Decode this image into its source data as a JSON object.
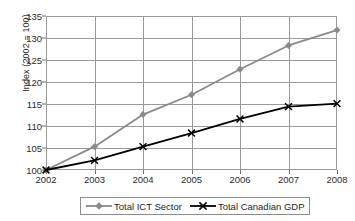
{
  "chart_data": {
    "type": "line",
    "title": "",
    "xlabel": "",
    "ylabel": "Index (2002 = 100)",
    "x": [
      2002,
      2003,
      2004,
      2005,
      2006,
      2007,
      2008
    ],
    "xtick_labels": [
      "2002",
      "2003",
      "2004",
      "2005",
      "2006",
      "2007",
      "2008"
    ],
    "ytick_labels": [
      "100",
      "105",
      "110",
      "115",
      "120",
      "125",
      "130",
      "135"
    ],
    "yticks": [
      100,
      105,
      110,
      115,
      120,
      125,
      130,
      135
    ],
    "ylim": [
      100,
      135
    ],
    "grid": true,
    "legend_position": "bottom",
    "series": [
      {
        "name": "Total ICT Sector",
        "color": "#8a8a8a",
        "marker": "diamond",
        "values": [
          100,
          105.3,
          112.6,
          117.1,
          122.9,
          128.3,
          131.8
        ]
      },
      {
        "name": "Total Canadian GDP",
        "color": "#000000",
        "marker": "x",
        "values": [
          100,
          102.2,
          105.3,
          108.4,
          111.6,
          114.4,
          115.1
        ]
      }
    ]
  }
}
